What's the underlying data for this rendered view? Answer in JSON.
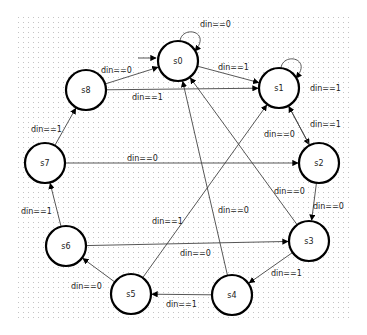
{
  "diagram": {
    "type": "state-machine",
    "initial_state": "s0",
    "grid": {
      "x": 18,
      "y": 17,
      "width": 334,
      "height": 305,
      "spacing": 5,
      "dot_color": "#c8c8c8"
    },
    "nodes": [
      {
        "id": "s0",
        "label": "s0",
        "x": 178,
        "y": 61
      },
      {
        "id": "s1",
        "label": "s1",
        "x": 279,
        "y": 88
      },
      {
        "id": "s2",
        "label": "s2",
        "x": 319,
        "y": 163
      },
      {
        "id": "s3",
        "label": "s3",
        "x": 309,
        "y": 241
      },
      {
        "id": "s4",
        "label": "s4",
        "x": 232,
        "y": 295
      },
      {
        "id": "s5",
        "label": "s5",
        "x": 131,
        "y": 294
      },
      {
        "id": "s6",
        "label": "s6",
        "x": 66,
        "y": 246
      },
      {
        "id": "s7",
        "label": "s7",
        "x": 45,
        "y": 163
      },
      {
        "id": "s8",
        "label": "s8",
        "x": 86,
        "y": 90
      }
    ],
    "edges": [
      {
        "from": "s0",
        "to": "s0",
        "label": "din==0",
        "lx": 200,
        "ly": 27
      },
      {
        "from": "s0",
        "to": "s1",
        "label": "din==1",
        "lx": 218,
        "ly": 70
      },
      {
        "from": "s1",
        "to": "s1",
        "label": "din==1",
        "lx": 310,
        "ly": 91
      },
      {
        "from": "s1",
        "to": "s2",
        "label": "din==0",
        "lx": 264,
        "ly": 137
      },
      {
        "from": "s2",
        "to": "s1",
        "label": "din==1",
        "lx": 310,
        "ly": 127
      },
      {
        "from": "s2",
        "to": "s3",
        "label": "din==0",
        "lx": 313,
        "ly": 209
      },
      {
        "from": "s3",
        "to": "s0",
        "label": "din==0",
        "lx": 274,
        "ly": 194
      },
      {
        "from": "s3",
        "to": "s4",
        "label": "din==1",
        "lx": 271,
        "ly": 276
      },
      {
        "from": "s4",
        "to": "s0",
        "label": "din==0",
        "lx": 218,
        "ly": 213
      },
      {
        "from": "s4",
        "to": "s5",
        "label": "din==1",
        "lx": 166,
        "ly": 307
      },
      {
        "from": "s5",
        "to": "s1",
        "label": "din==1",
        "lx": 152,
        "ly": 224
      },
      {
        "from": "s5",
        "to": "s6",
        "label": "din==0",
        "lx": 71,
        "ly": 289
      },
      {
        "from": "s6",
        "to": "s3",
        "label": "din==0",
        "lx": 180,
        "ly": 256
      },
      {
        "from": "s6",
        "to": "s7",
        "label": "din==1",
        "lx": 21,
        "ly": 214
      },
      {
        "from": "s7",
        "to": "s2",
        "label": "din==0",
        "lx": 127,
        "ly": 161
      },
      {
        "from": "s7",
        "to": "s8",
        "label": "din==1",
        "lx": 31,
        "ly": 132
      },
      {
        "from": "s8",
        "to": "s0",
        "label": "din==0",
        "lx": 101,
        "ly": 73
      },
      {
        "from": "s8",
        "to": "s1",
        "label": "din==1",
        "lx": 132,
        "ly": 100
      }
    ]
  }
}
